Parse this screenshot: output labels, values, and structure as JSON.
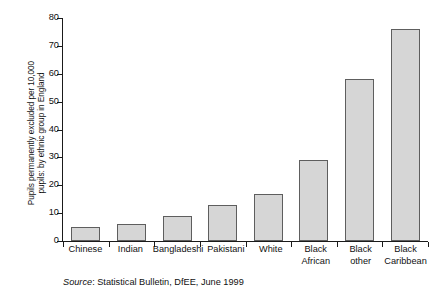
{
  "chart_data": {
    "type": "bar",
    "title": "",
    "xlabel": "",
    "ylabel": "Pupils permanently excluded per 10,000 pupils: by ethnic group in England",
    "ylabel_lines": [
      "Pupils permanently excluded per 10,000",
      "pupils: by ethnic group in England"
    ],
    "categories": [
      "Chinese",
      "Indian",
      "Bangladeshi",
      "Pakistani",
      "White",
      "Black African",
      "Black other",
      "Black Caribbean"
    ],
    "category_labels": [
      "Chinese",
      "Indian",
      "Bangladeshi",
      "Pakistani",
      "White",
      "Black\nAfrican",
      "Black\nother",
      "Black\nCaribbean"
    ],
    "values": [
      5,
      6,
      9,
      13,
      17,
      29,
      58,
      76
    ],
    "ylim": [
      0,
      80
    ],
    "yticks": [
      0,
      10,
      20,
      30,
      40,
      50,
      60,
      70,
      80
    ],
    "ytick_labels": [
      "0",
      "10",
      "20",
      "30",
      "40",
      "50",
      "60",
      "70",
      "80"
    ],
    "grid": false,
    "legend": "none",
    "bar_fill_color": "#d6d6d6",
    "bar_border_color": "#5e5e5e",
    "axis_color": "#1a1a1a"
  },
  "caption": {
    "source_word": "Source",
    "source_text": ": Statistical Bulletin, DfEE, June 1999"
  }
}
